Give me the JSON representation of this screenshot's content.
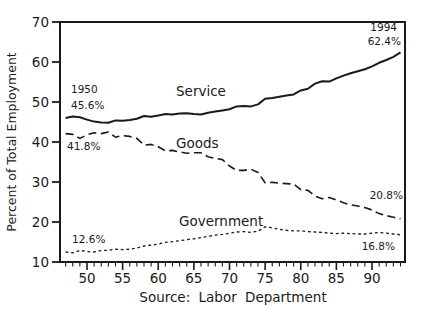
{
  "figure": {
    "background": "#ffffff",
    "ink": "#1a1a1a"
  },
  "chart_data": {
    "type": "line",
    "title": "",
    "ylabel": "Percent of Total Employment",
    "source": "Source: Labor Department",
    "grid": false,
    "legend": "inline labels beside each line",
    "y_axis": {
      "range": [
        10,
        70
      ],
      "ticks": [
        70,
        60,
        50,
        40,
        30,
        20,
        10
      ],
      "tick_labels": [
        "70",
        "60",
        "50",
        "40",
        "30",
        "20",
        "10"
      ]
    },
    "x_axis": {
      "range_years": [
        1947,
        1994
      ],
      "major_ticks": [
        1950,
        1955,
        1960,
        1965,
        1970,
        1975,
        1980,
        1985,
        1990
      ],
      "major_tick_labels": [
        "50",
        "55",
        "60",
        "65",
        "70",
        "75",
        "80",
        "85",
        "90"
      ],
      "minor_tick_step_years": 1
    },
    "years": [
      1947,
      1948,
      1949,
      1950,
      1951,
      1952,
      1953,
      1954,
      1955,
      1956,
      1957,
      1958,
      1959,
      1960,
      1961,
      1962,
      1963,
      1964,
      1965,
      1966,
      1967,
      1968,
      1969,
      1970,
      1971,
      1972,
      1973,
      1974,
      1975,
      1976,
      1977,
      1978,
      1979,
      1980,
      1981,
      1982,
      1983,
      1984,
      1985,
      1986,
      1987,
      1988,
      1989,
      1990,
      1991,
      1992,
      1993,
      1994
    ],
    "series": [
      {
        "name": "Service",
        "line_style": "solid",
        "values": [
          46.0,
          46.4,
          46.2,
          45.6,
          45.1,
          44.9,
          44.8,
          45.4,
          45.3,
          45.5,
          45.8,
          46.5,
          46.3,
          46.6,
          47.0,
          46.9,
          47.1,
          47.2,
          47.0,
          46.9,
          47.3,
          47.6,
          47.9,
          48.2,
          48.9,
          49.0,
          48.9,
          49.4,
          50.8,
          51.0,
          51.3,
          51.6,
          51.9,
          52.9,
          53.3,
          54.6,
          55.2,
          55.1,
          55.9,
          56.6,
          57.2,
          57.7,
          58.2,
          58.9,
          59.8,
          60.5,
          61.3,
          62.4
        ]
      },
      {
        "name": "Goods",
        "line_style": "dashed",
        "values": [
          42.1,
          41.9,
          40.9,
          41.8,
          42.3,
          42.1,
          42.5,
          41.2,
          41.6,
          41.4,
          40.9,
          39.2,
          39.4,
          38.8,
          37.8,
          37.9,
          37.5,
          37.2,
          37.3,
          37.3,
          36.3,
          35.9,
          35.6,
          34.0,
          32.9,
          32.9,
          33.2,
          32.4,
          29.8,
          29.9,
          29.7,
          29.6,
          29.5,
          28.1,
          27.9,
          26.5,
          25.8,
          26.1,
          25.5,
          24.8,
          24.3,
          24.0,
          23.6,
          23.0,
          22.1,
          21.6,
          21.2,
          20.8
        ]
      },
      {
        "name": "Government",
        "line_style": "short-dash",
        "values": [
          12.5,
          12.3,
          12.9,
          12.6,
          12.5,
          12.9,
          12.9,
          13.2,
          13.1,
          13.2,
          13.5,
          14.0,
          14.2,
          14.5,
          14.9,
          15.1,
          15.3,
          15.6,
          15.8,
          16.1,
          16.4,
          16.7,
          16.9,
          17.2,
          17.5,
          17.6,
          17.4,
          17.7,
          18.8,
          18.5,
          18.2,
          17.9,
          17.8,
          17.8,
          17.6,
          17.5,
          17.4,
          17.2,
          17.1,
          17.2,
          17.1,
          17.0,
          17.0,
          17.2,
          17.4,
          17.2,
          17.0,
          16.8
        ]
      }
    ],
    "annotations": {
      "start_year": "1950",
      "start_service": "45.6%",
      "start_goods": "41.8%",
      "start_government": "12.6%",
      "end_year": "1994",
      "end_service": "62.4%",
      "end_goods": "20.8%",
      "end_government": "16.8%"
    }
  }
}
